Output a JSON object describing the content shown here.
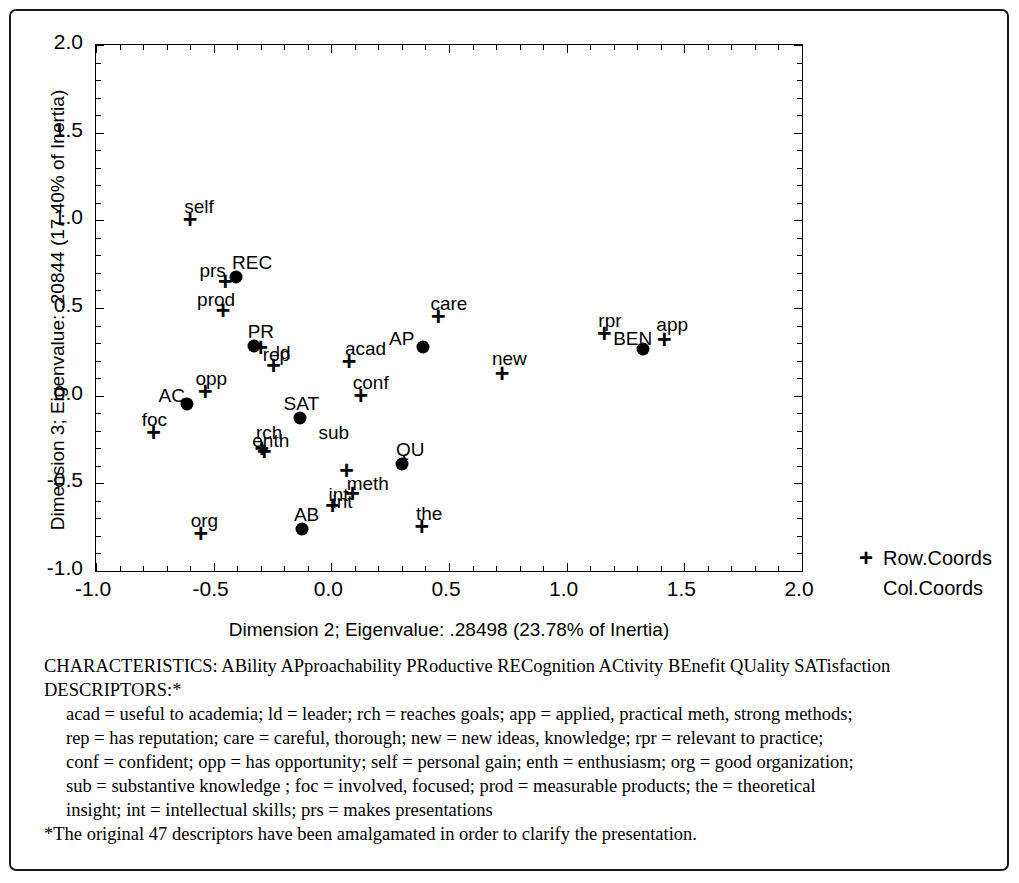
{
  "chart_data": {
    "type": "scatter",
    "title": "",
    "xlabel": "Dimension 2; Eigenvalue: .28498 (23.78% of Inertia)",
    "ylabel": "Dimension 3; Eigenvalue: .20844 (17.40% of Inertia)",
    "xlim": [
      -1.0,
      2.0
    ],
    "ylim": [
      -1.0,
      2.0
    ],
    "xticks": [
      "-1.0",
      "-0.5",
      "0.0",
      "0.5",
      "1.0",
      "1.5",
      "2.0"
    ],
    "xtick_values": [
      -1.0,
      -0.5,
      0.0,
      0.5,
      1.0,
      1.5,
      2.0
    ],
    "yticks": [
      "-1.0",
      "-0.5",
      "0.0",
      "0.5",
      "1.0",
      "1.5",
      "2.0"
    ],
    "ytick_values": [
      -1.0,
      -0.5,
      0.0,
      0.5,
      1.0,
      1.5,
      2.0
    ],
    "grid": false,
    "legend_position": "right-bottom-outside",
    "legend": [
      "Row.Coords",
      "Col.Coords"
    ],
    "series": [
      {
        "name": "Row.Coords",
        "marker": "plus",
        "points": [
          {
            "label": "self",
            "x": -0.6,
            "y": 1.01,
            "lx": -6,
            "ly": -22
          },
          {
            "label": "prs",
            "x": -0.45,
            "y": 0.655,
            "lx": -26,
            "ly": -20
          },
          {
            "label": "prod",
            "x": -0.46,
            "y": 0.49,
            "lx": -26,
            "ly": -20
          },
          {
            "label": "rep",
            "x": -0.3,
            "y": 0.275,
            "lx": 2,
            "ly": -2
          },
          {
            "label": "ld",
            "x": -0.245,
            "y": 0.175,
            "lx": 2,
            "ly": -22
          },
          {
            "label": "acad",
            "x": 0.075,
            "y": 0.195,
            "lx": -4,
            "ly": -22
          },
          {
            "label": "care",
            "x": 0.455,
            "y": 0.455,
            "lx": -8,
            "ly": -22
          },
          {
            "label": "rpr",
            "x": 1.16,
            "y": 0.355,
            "lx": -6,
            "ly": -22
          },
          {
            "label": "app",
            "x": 1.415,
            "y": 0.325,
            "lx": -8,
            "ly": -24
          },
          {
            "label": "conf",
            "x": 0.125,
            "y": 0.005,
            "lx": -8,
            "ly": -22
          },
          {
            "label": "opp",
            "x": -0.535,
            "y": 0.025,
            "lx": -10,
            "ly": -22
          },
          {
            "label": "new",
            "x": 0.725,
            "y": 0.13,
            "lx": -10,
            "ly": -24
          },
          {
            "label": "foc",
            "x": -0.755,
            "y": -0.205,
            "lx": -12,
            "ly": -22
          },
          {
            "label": "rch",
            "x": -0.295,
            "y": -0.3,
            "lx": -6,
            "ly": -25
          },
          {
            "label": "enth",
            "x": -0.285,
            "y": -0.315,
            "lx": -12,
            "ly": -20
          },
          {
            "label": "int",
            "x": 0.005,
            "y": -0.625,
            "lx": -4,
            "ly": -20
          },
          {
            "label": "meth",
            "x": 0.065,
            "y": -0.425,
            "lx": 0,
            "ly": 4
          },
          {
            "label": "org",
            "x": -0.555,
            "y": -0.785,
            "lx": -10,
            "ly": -22
          },
          {
            "label": "the",
            "x": 0.385,
            "y": -0.745,
            "lx": -6,
            "ly": -22
          },
          {
            "label": "",
            "x": 0.09,
            "y": -0.555,
            "lx": 0,
            "ly": 0
          }
        ]
      },
      {
        "name": "Col.Coords",
        "marker": "dot",
        "points": [
          {
            "label": "REC",
            "x": -0.405,
            "y": 0.675,
            "lx": -4,
            "ly": -24
          },
          {
            "label": "PR",
            "x": -0.33,
            "y": 0.285,
            "lx": -6,
            "ly": -24
          },
          {
            "label": "AC",
            "x": -0.615,
            "y": -0.05,
            "lx": -28,
            "ly": -18
          },
          {
            "label": "SAT",
            "x": -0.135,
            "y": -0.13,
            "lx": -16,
            "ly": -24
          },
          {
            "label": "AP",
            "x": 0.39,
            "y": 0.28,
            "lx": -34,
            "ly": -18
          },
          {
            "label": "BEN",
            "x": 1.325,
            "y": 0.265,
            "lx": -30,
            "ly": -20
          },
          {
            "label": "QU",
            "x": 0.3,
            "y": -0.39,
            "lx": -6,
            "ly": -24
          },
          {
            "label": "AB",
            "x": -0.125,
            "y": -0.76,
            "lx": -8,
            "ly": -24
          }
        ]
      }
    ],
    "extra_labels": [
      {
        "text": "sub",
        "x": -0.055,
        "y": -0.155
      },
      {
        "text": "int",
        "x": 0.005,
        "y": -0.55
      }
    ]
  },
  "legend": {
    "row_symbol": "+",
    "row_label": "Row.Coords",
    "col_label": "Col.Coords"
  },
  "footnotes": {
    "line1": "CHARACTERISTICS: ABility APproachability PRoductive RECognition ACtivity BEnefit QUality SATisfaction",
    "line2": "DESCRIPTORS:*",
    "line3": "acad = useful to academia; ld = leader; rch = reaches goals; app = applied, practical meth, strong methods;",
    "line4": "rep = has reputation; care = careful, thorough; new = new ideas, knowledge; rpr = relevant to practice;",
    "line5": "conf = confident; opp = has opportunity; self = personal gain; enth = enthusiasm; org = good organization;",
    "line6": "sub = substantive knowledge ; foc = involved, focused; prod = measurable products; the = theoretical",
    "line7": "insight; int = intellectual skills; prs = makes presentations",
    "line8": "*The original 47 descriptors have been amalgamated in order to clarify the presentation."
  }
}
